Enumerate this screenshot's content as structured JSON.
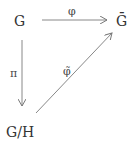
{
  "diagram": {
    "type": "commutative-diagram",
    "nodes": {
      "top_left": "G",
      "top_right": "Ḡ",
      "bottom_left": "G/H"
    },
    "arrows": [
      {
        "from": "G",
        "to": "Ḡ",
        "label": "φ"
      },
      {
        "from": "G",
        "to": "G/H",
        "label": "π"
      },
      {
        "from": "G/H",
        "to": "Ḡ",
        "label": "φ̃"
      }
    ],
    "colors": {
      "text": "#333333",
      "arrow": "#777777"
    }
  }
}
